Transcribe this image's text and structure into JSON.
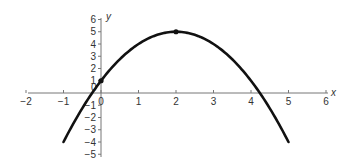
{
  "chart_data": {
    "type": "line",
    "title": "",
    "xlabel": "x",
    "ylabel": "y",
    "xlim": [
      -2,
      6
    ],
    "ylim": [
      -5,
      6
    ],
    "grid": false,
    "legend": null,
    "x_ticks": [
      -2,
      -1,
      0,
      1,
      2,
      3,
      4,
      5,
      6
    ],
    "x_tick_labels": [
      "−2",
      "−1",
      "0",
      "1",
      "2",
      "3",
      "4",
      "5",
      "6"
    ],
    "y_ticks": [
      -5,
      -4,
      -3,
      -2,
      -1,
      1,
      2,
      3,
      4,
      5,
      6
    ],
    "y_tick_labels": [
      "−5",
      "−4",
      "−3",
      "−2",
      "−1",
      "1",
      "2",
      "3",
      "4",
      "5",
      "6"
    ],
    "origin_label": "0",
    "series": [
      {
        "name": "y = -x^2 + 4x + 1",
        "x": [
          -1,
          -0.5,
          0,
          0.5,
          1,
          1.5,
          2,
          2.5,
          3,
          3.5,
          4,
          4.5,
          5
        ],
        "values": [
          -4,
          -1.25,
          1,
          2.75,
          4,
          4.75,
          5,
          4.75,
          4,
          2.75,
          1,
          -1.25,
          -4
        ],
        "color": "#111111"
      }
    ],
    "marked_points": [
      {
        "x": 0,
        "y": 1
      },
      {
        "x": 2,
        "y": 5
      }
    ]
  }
}
